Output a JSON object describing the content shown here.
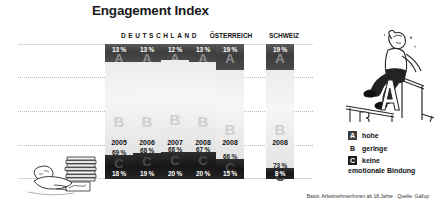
{
  "title": "Engagement Index",
  "countries": [
    {
      "name": "DEUTSCHLAND",
      "spaced": true
    },
    {
      "name": "ÖSTERREICH",
      "spaced": false
    },
    {
      "name": "SCHWEIZ",
      "spaced": false
    }
  ],
  "legend": {
    "items": [
      {
        "key": "A",
        "label": "hohe"
      },
      {
        "key": "B",
        "label": "geringe"
      },
      {
        "key": "C",
        "label": "keine"
      }
    ],
    "footer": "emotionale Bindung"
  },
  "source": "Basis: Arbeitnehmer/innen ab 18 Jahre · Quelle: Gallup",
  "illustrations": {
    "top_right": "man-sitting-on-A-podium",
    "bottom_left": "man-lying-with-paper-stack"
  },
  "colors": {
    "segment_a": "#3d3d3d",
    "segment_b": "#ececed",
    "segment_c": "#1c1c1c",
    "text": "#111111",
    "grid": "#b9b9b9"
  },
  "chart_data": {
    "type": "bar",
    "title": "Engagement Index",
    "subtitle": "",
    "xlabel": "",
    "ylabel": "",
    "stacked": true,
    "ylim": [
      0,
      100
    ],
    "grid": true,
    "legend_position": "right",
    "categories": [
      "2005",
      "2006",
      "2007",
      "2008",
      "2008",
      "2008"
    ],
    "groups": [
      "DEUTSCHLAND",
      "DEUTSCHLAND",
      "DEUTSCHLAND",
      "DEUTSCHLAND",
      "ÖSTERREICH",
      "SCHWEIZ"
    ],
    "series": [
      {
        "name": "A hohe emotionale Bindung",
        "values": [
          13,
          13,
          12,
          13,
          19,
          19
        ],
        "labels": [
          "13 %",
          "13 %",
          "12 %",
          "13 %",
          "19 %",
          "19 %"
        ]
      },
      {
        "name": "B geringe emotionale Bindung",
        "values": [
          69,
          68,
          68,
          67,
          66,
          73
        ],
        "labels": [
          "69 %",
          "68 %",
          "68 %",
          "67 %",
          "66 %",
          "73 %"
        ]
      },
      {
        "name": "C keine emotionale Bindung",
        "values": [
          18,
          19,
          20,
          20,
          15,
          8
        ],
        "labels": [
          "18 %",
          "19 %",
          "20 %",
          "20 %",
          "15 %",
          "8 %"
        ]
      }
    ],
    "bars": [
      {
        "year": "2005",
        "country": "DEUTSCHLAND",
        "a": 13,
        "b": 69,
        "c": 18,
        "a_label": "13 %",
        "b_label": "69 %",
        "c_label": "18 %"
      },
      {
        "year": "2006",
        "country": "DEUTSCHLAND",
        "a": 13,
        "b": 68,
        "c": 19,
        "a_label": "13 %",
        "b_label": "68 %",
        "c_label": "19 %"
      },
      {
        "year": "2007",
        "country": "DEUTSCHLAND",
        "a": 12,
        "b": 68,
        "c": 20,
        "a_label": "12 %",
        "b_label": "68 %",
        "c_label": "20 %"
      },
      {
        "year": "2008",
        "country": "DEUTSCHLAND",
        "a": 13,
        "b": 67,
        "c": 20,
        "a_label": "13 %",
        "b_label": "67 %",
        "c_label": "20 %"
      },
      {
        "year": "2008",
        "country": "ÖSTERREICH",
        "a": 19,
        "b": 66,
        "c": 15,
        "a_label": "19 %",
        "b_label": "66 %",
        "c_label": "15 %"
      },
      {
        "year": "2008",
        "country": "SCHWEIZ",
        "a": 19,
        "b": 73,
        "c": 8,
        "a_label": "19 %",
        "b_label": "73 %",
        "c_label": "8 %"
      }
    ]
  }
}
